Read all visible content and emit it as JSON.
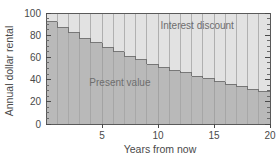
{
  "chart_data": {
    "type": "bar",
    "title": "",
    "xlabel": "Years from now",
    "ylabel": "Annual dollar rental",
    "xlim": [
      0,
      20
    ],
    "ylim": [
      0,
      100
    ],
    "grid": false,
    "legend_position": "inside-annotations",
    "categories": [
      1,
      2,
      3,
      4,
      5,
      6,
      7,
      8,
      9,
      10,
      11,
      12,
      13,
      14,
      15,
      16,
      17,
      18,
      19,
      20
    ],
    "x_ticks": [
      5,
      10,
      15,
      20
    ],
    "x_tick_labels": [
      "5",
      "10",
      "15",
      "20"
    ],
    "y_ticks": [
      0,
      20,
      40,
      60,
      80,
      100
    ],
    "y_tick_labels": [
      "0",
      "20",
      "40",
      "60",
      "80",
      "100"
    ],
    "y_minor_ticks": [
      5,
      10,
      15,
      25,
      30,
      35,
      45,
      50,
      55,
      65,
      70,
      75,
      85,
      90,
      95
    ],
    "total_value": 100,
    "series": [
      {
        "name": "Present value",
        "color": "#b9b9b9",
        "values": [
          92,
          87,
          82,
          77,
          73,
          69,
          65,
          61,
          58,
          54,
          51,
          48,
          46,
          43,
          41,
          38,
          36,
          34,
          31,
          29
        ]
      },
      {
        "name": "Interest discount",
        "color": "#e2e2e2",
        "values": [
          8,
          13,
          18,
          23,
          27,
          31,
          35,
          39,
          42,
          46,
          49,
          52,
          54,
          57,
          59,
          62,
          64,
          66,
          69,
          71
        ]
      }
    ],
    "annotations": [
      {
        "text": "Interest discount",
        "x": 13.5,
        "y": 86
      },
      {
        "text": "Present value",
        "x": 6.6,
        "y": 34
      }
    ]
  },
  "axes": {
    "y_axis_title": "Annual dollar rental",
    "x_axis_title": "Years from now"
  },
  "colors": {
    "present_value_fill": "#b9b9b9",
    "interest_discount_fill": "#e2e2e2",
    "axis": "#5a5a5a",
    "text": "#4a4a4a",
    "annotation_text": "#6e6e6e",
    "separator": "#9a9a9a",
    "background": "#ffffff"
  }
}
